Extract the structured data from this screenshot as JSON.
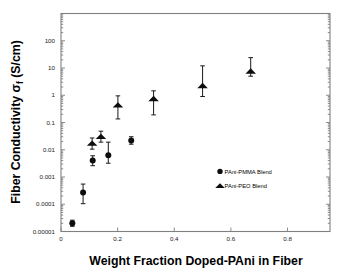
{
  "chart_data": {
    "type": "scatter",
    "title": "",
    "xlabel": "Weight Fraction Doped-PAni in Fiber",
    "ylabel": "Fiber Conductivity σf (S/cm)",
    "ylabel_main": "Fiber Conductivity ",
    "ylabel_sigma": "σ",
    "ylabel_sub": "f",
    "ylabel_units": " (S/cm)",
    "yscale": "log",
    "xscale": "linear",
    "xlim": [
      0.0,
      0.95
    ],
    "ylim": [
      1e-05,
      1000
    ],
    "grid": false,
    "legend_position": "lower right",
    "xticks": [
      0,
      0.2,
      0.4,
      0.6,
      0.8
    ],
    "xtick_labels": [
      "0",
      "0.2",
      "0.4",
      "0.6",
      "0.8"
    ],
    "yticks": [
      1e-05,
      0.0001,
      0.001,
      0.01,
      0.1,
      1,
      10,
      100
    ],
    "ytick_labels": [
      "0.00001",
      "0.0001",
      "0.001",
      "0.01",
      "0.1",
      "1",
      "10",
      "100"
    ],
    "series": [
      {
        "name": "PAni-PMMA Blend",
        "marker": "circle",
        "color": "#0d0d0d",
        "points": [
          {
            "x": 0.04,
            "y": 2e-05,
            "ylow": 1.55e-05,
            "yhigh": 2.6e-05
          },
          {
            "x": 0.078,
            "y": 0.00027,
            "ylow": 0.000105,
            "yhigh": 0.00055
          },
          {
            "x": 0.112,
            "y": 0.004,
            "ylow": 0.0026,
            "yhigh": 0.006
          },
          {
            "x": 0.167,
            "y": 0.0063,
            "ylow": 0.0032,
            "yhigh": 0.019
          },
          {
            "x": 0.248,
            "y": 0.022,
            "ylow": 0.016,
            "yhigh": 0.03
          }
        ]
      },
      {
        "name": "PAni-PEO Blend",
        "marker": "triangle",
        "color": "#0d0d0d",
        "points": [
          {
            "x": 0.11,
            "y": 0.017,
            "ylow": 0.0105,
            "yhigh": 0.027
          },
          {
            "x": 0.141,
            "y": 0.03,
            "ylow": 0.019,
            "yhigh": 0.048
          },
          {
            "x": 0.201,
            "y": 0.43,
            "ylow": 0.135,
            "yhigh": 0.95
          },
          {
            "x": 0.327,
            "y": 0.74,
            "ylow": 0.19,
            "yhigh": 1.45
          },
          {
            "x": 0.5,
            "y": 2.2,
            "ylow": 0.9,
            "yhigh": 12.0
          },
          {
            "x": 0.67,
            "y": 7.5,
            "ylow": 5.0,
            "yhigh": 24.0
          }
        ]
      }
    ],
    "legend": [
      {
        "label": "PAni-PMMA Blend",
        "marker": "circle"
      },
      {
        "label": "PAni-PEO Blend",
        "marker": "triangle"
      }
    ]
  }
}
